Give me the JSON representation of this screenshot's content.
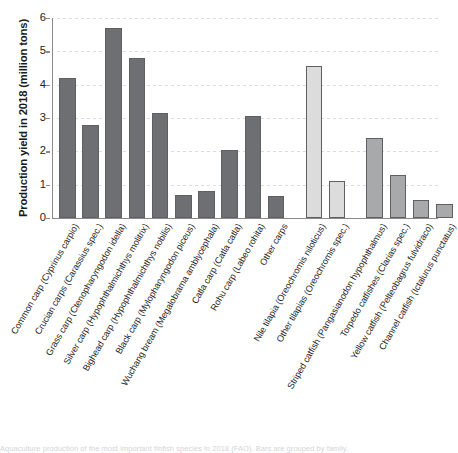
{
  "chart_data": {
    "type": "bar",
    "title": "",
    "xlabel": "",
    "ylabel": "Production yield in 2018 (million tons)",
    "ylim": [
      0,
      6
    ],
    "yticks": [
      0,
      1,
      2,
      3,
      4,
      5,
      6
    ],
    "grid": true,
    "legend": "none",
    "categories": [
      "Common carp (Cyprinus carpio)",
      "Crucian carps (Carassius spec.)",
      "Grass carp (Ctenopharyngodon idella)",
      "Silver carp (Hypophthalmichthys molitrix)",
      "Bighead carp (Hypophthalmichthys nobilis)",
      "Black carp (Mylopharyngodon piceus)",
      "Wuchang bream (Megalobrama amblycephala)",
      "Catla carp (Catla catla)",
      "Rohu carp (Labeo rohita)",
      "Other carps",
      "Nile tilapia (Oreochromis niloticus)",
      "Other tilapias (Oreochromis spec.)",
      "Striped catfish (Pangasianodon hypophthalmus)",
      "Torpedo catfishes (Clarias spec.)",
      "Yellow catfish (Pelteobagrus fulvidraco)",
      "Channel catfish (Ictalurus punctatus)"
    ],
    "values": [
      4.2,
      2.8,
      5.7,
      4.8,
      3.15,
      0.7,
      0.8,
      2.05,
      3.05,
      0.67,
      4.55,
      1.1,
      2.4,
      1.3,
      0.55,
      0.42
    ],
    "groups": [
      {
        "name": "carps",
        "color": "#6e6f72",
        "indices": [
          0,
          1,
          2,
          3,
          4,
          5,
          6,
          7,
          8,
          9
        ]
      },
      {
        "name": "tilapias",
        "color": "#dcdcdc",
        "indices": [
          10,
          11
        ]
      },
      {
        "name": "catfishes",
        "color": "#a8a9ab",
        "indices": [
          12,
          13,
          14,
          15
        ]
      }
    ]
  },
  "caption": {
    "text": "Aquaculture production of the most important finfish species in 2018 (FAO). Bars are grouped by family."
  }
}
